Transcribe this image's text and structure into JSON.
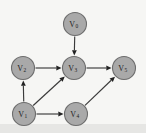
{
  "figure": {
    "width": 146,
    "height": 133,
    "background_color": "#f6f6f4",
    "bottom_band_color": "#e6e6e4"
  },
  "style": {
    "node_fill": "#a9a9a9",
    "node_stroke": "#6d6d6d",
    "node_radius": 11.5,
    "label_color": "#1c1c1c",
    "edge_color": "#3a3a3a",
    "arrow_color": "#222222"
  },
  "chart_data": {
    "type": "diagram",
    "diagram_kind": "directed-graph",
    "directed": true,
    "node_count": 6,
    "edge_count": 7,
    "nodes": [
      {
        "id": "v0",
        "label": "V",
        "sub": "0",
        "x": 75,
        "y": 24
      },
      {
        "id": "v2",
        "label": "V",
        "sub": "2",
        "x": 23,
        "y": 68
      },
      {
        "id": "v3",
        "label": "V",
        "sub": "3",
        "x": 74,
        "y": 68
      },
      {
        "id": "v5",
        "label": "V",
        "sub": "5",
        "x": 124,
        "y": 68
      },
      {
        "id": "v1",
        "label": "V",
        "sub": "1",
        "x": 24,
        "y": 114
      },
      {
        "id": "v4",
        "label": "V",
        "sub": "4",
        "x": 76,
        "y": 114
      }
    ],
    "edges": [
      {
        "id": "e-v0-v3",
        "from": "v0",
        "to": "v3",
        "label": ""
      },
      {
        "id": "e-v2-v3",
        "from": "v2",
        "to": "v3",
        "label": ""
      },
      {
        "id": "e-v3-v5",
        "from": "v3",
        "to": "v5",
        "label": ""
      },
      {
        "id": "e-v1-v2",
        "from": "v1",
        "to": "v2",
        "label": ""
      },
      {
        "id": "e-v1-v3",
        "from": "v1",
        "to": "v3",
        "label": ""
      },
      {
        "id": "e-v1-v4",
        "from": "v1",
        "to": "v4",
        "label": ""
      },
      {
        "id": "e-v4-v5",
        "from": "v4",
        "to": "v5",
        "label": ""
      }
    ]
  }
}
